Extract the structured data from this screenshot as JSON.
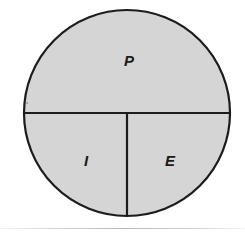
{
  "figure": {
    "type": "venn-partition-circle-diagram",
    "background_color": "#ffffff",
    "circle": {
      "center_x": 127,
      "center_y": 113,
      "radius": 103,
      "fill_color": "#d5d5d5",
      "stroke_color": "#1c1c1c",
      "stroke_width": 2.2
    },
    "dividers": [
      {
        "name": "horizontal-diameter",
        "orientation": "horizontal",
        "x1": 24,
        "y1": 113,
        "x2": 230,
        "y2": 113,
        "stroke_color": "#1c1c1c",
        "stroke_width": 2.2
      },
      {
        "name": "vertical-radius",
        "orientation": "vertical",
        "x1": 127,
        "y1": 113,
        "x2": 127,
        "y2": 216,
        "stroke_color": "#1c1c1c",
        "stroke_width": 2.2
      }
    ],
    "speck": {
      "name": "stray-speck",
      "x": 27,
      "y": 103,
      "radius": 1.1,
      "color": "#9a9a9a"
    },
    "labels": [
      {
        "text": "P",
        "x": 129,
        "y": 62,
        "region": "upper-half"
      },
      {
        "text": "I",
        "x": 86,
        "y": 162,
        "region": "lower-left-quadrant"
      },
      {
        "text": "E",
        "x": 170,
        "y": 162,
        "region": "lower-right-quadrant"
      }
    ],
    "bottom_rule": {
      "name": "bottom-rule",
      "y": 228,
      "color": "#bcbcbc"
    }
  }
}
